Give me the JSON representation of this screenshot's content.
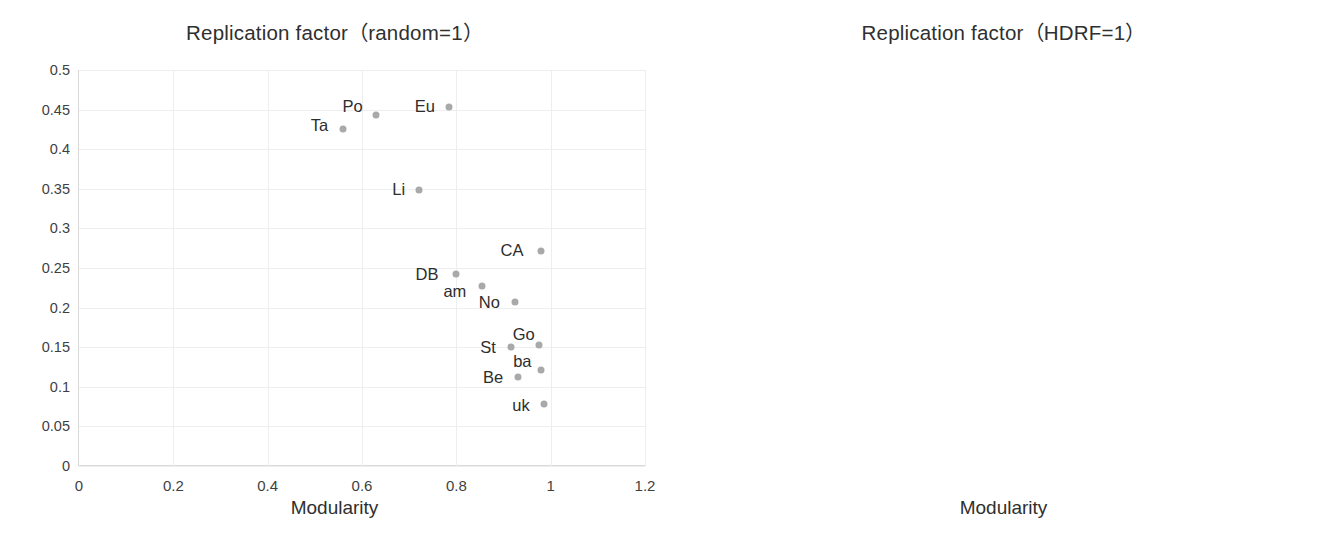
{
  "figure": {
    "panels": [
      {
        "key": "left",
        "title": "Replication factor（random=1）",
        "xlabel": "Modularity",
        "xticks": [
          "0",
          "0.2",
          "0.4",
          "0.6",
          "0.8",
          "1",
          "1.2"
        ],
        "yticks": [
          "0",
          "0.05",
          "0.1",
          "0.15",
          "0.2",
          "0.25",
          "0.3",
          "0.35",
          "0.4",
          "0.45",
          "0.5"
        ]
      },
      {
        "key": "right",
        "title": "Replication factor（HDRF=1）",
        "xlabel": "Modularity",
        "xticks": [
          "0",
          "0.2",
          "0.4",
          "0.6",
          "0.8",
          "1",
          "1.2"
        ],
        "yticks": [
          "0",
          "0.2",
          "0.4",
          "0.6",
          "0.8",
          "1",
          "1.2"
        ]
      }
    ]
  },
  "chart_data": [
    {
      "type": "scatter",
      "title": "Replication factor（random=1）",
      "xlabel": "Modularity",
      "ylabel": "",
      "xlim": [
        0,
        1.2
      ],
      "ylim": [
        0,
        0.5
      ],
      "xtick_step": 0.2,
      "ytick_step": 0.05,
      "grid": true,
      "marker_color": "#a9a9a9",
      "points": [
        {
          "label": "Ta",
          "x": 0.56,
          "y": 0.425,
          "lx": -0.05,
          "ly": 0.006
        },
        {
          "label": "Po",
          "x": 0.63,
          "y": 0.443,
          "lx": -0.05,
          "ly": 0.011
        },
        {
          "label": "Eu",
          "x": 0.785,
          "y": 0.453,
          "lx": -0.052,
          "ly": 0.001
        },
        {
          "label": "Li",
          "x": 0.72,
          "y": 0.349,
          "lx": -0.042,
          "ly": 0.001
        },
        {
          "label": "CA",
          "x": 0.98,
          "y": 0.272,
          "lx": -0.062,
          "ly": 0.001
        },
        {
          "label": "DB",
          "x": 0.8,
          "y": 0.243,
          "lx": -0.062,
          "ly": 0.0
        },
        {
          "label": "am",
          "x": 0.855,
          "y": 0.227,
          "lx": -0.058,
          "ly": -0.006
        },
        {
          "label": "No",
          "x": 0.925,
          "y": 0.207,
          "lx": -0.055,
          "ly": 0.0
        },
        {
          "label": "Go",
          "x": 0.975,
          "y": 0.153,
          "lx": -0.032,
          "ly": 0.014
        },
        {
          "label": "St",
          "x": 0.915,
          "y": 0.15,
          "lx": -0.048,
          "ly": 0.0
        },
        {
          "label": "ba",
          "x": 0.98,
          "y": 0.121,
          "lx": -0.04,
          "ly": 0.012
        },
        {
          "label": "Be",
          "x": 0.93,
          "y": 0.113,
          "lx": -0.052,
          "ly": -0.001
        },
        {
          "label": "uk",
          "x": 0.985,
          "y": 0.078,
          "lx": -0.048,
          "ly": -0.001
        }
      ]
    },
    {
      "type": "scatter",
      "title": "Replication factor（HDRF=1）",
      "xlabel": "Modularity",
      "ylabel": "",
      "xlim": [
        0,
        1.2
      ],
      "ylim": [
        0,
        1.2
      ],
      "xtick_step": 0.2,
      "ytick_step": 0.2,
      "grid": true,
      "marker_color": "#a9a9a9",
      "points": [
        {
          "label": "Po",
          "x": 0.632,
          "y": 1.14,
          "lx": -0.048,
          "ly": 0.022
        },
        {
          "label": "Li",
          "x": 0.722,
          "y": 0.86,
          "lx": -0.04,
          "ly": 0.003
        },
        {
          "label": "Ta",
          "x": 0.565,
          "y": 0.565,
          "lx": -0.048,
          "ly": 0.003
        },
        {
          "label": "Eu",
          "x": 0.782,
          "y": 0.555,
          "lx": -0.05,
          "ly": 0.0
        },
        {
          "label": "am",
          "x": 0.855,
          "y": 0.545,
          "lx": -0.05,
          "ly": 0.075,
          "leader": true
        },
        {
          "label": "DB",
          "x": 0.81,
          "y": 0.533,
          "lx": -0.052,
          "ly": -0.055
        },
        {
          "label": "No",
          "x": 0.915,
          "y": 0.432,
          "lx": -0.045,
          "ly": 0.068
        },
        {
          "label": "Go",
          "x": 0.942,
          "y": 0.44,
          "lx": 0.028,
          "ly": 0.048
        },
        {
          "label": "St",
          "x": 0.905,
          "y": 0.43,
          "lx": -0.058,
          "ly": -0.01,
          "leader": true
        },
        {
          "label": "CA",
          "x": 0.985,
          "y": 0.398,
          "lx": 0.075,
          "ly": 0.04,
          "leader": true
        },
        {
          "label": "Be",
          "x": 0.93,
          "y": 0.365,
          "lx": -0.05,
          "ly": 0.0
        },
        {
          "label": "ba",
          "x": 0.972,
          "y": 0.358,
          "lx": -0.062,
          "ly": -0.068,
          "leader": true
        },
        {
          "label": "uk",
          "x": 0.985,
          "y": 0.305,
          "lx": -0.04,
          "ly": -0.098,
          "leader": true
        },
        {
          "label": "",
          "x": 0.965,
          "y": 0.4,
          "lx": 0,
          "ly": 0
        },
        {
          "label": "",
          "x": 0.985,
          "y": 0.398,
          "lx": 0,
          "ly": 0
        },
        {
          "label": "",
          "x": 0.925,
          "y": 0.437,
          "lx": 0,
          "ly": 0
        }
      ]
    }
  ]
}
